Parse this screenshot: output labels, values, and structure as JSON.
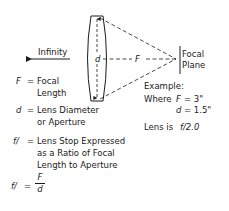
{
  "diagram": {
    "infinity_label": "Infinity",
    "lens_d_label": "d",
    "focal_F_label": "F",
    "focal_plane_label": [
      "Focal",
      "Plane"
    ],
    "legend": {
      "F": {
        "symbol": "F",
        "eq": "=",
        "line1": "Focal",
        "line2": "Length"
      },
      "d": {
        "symbol": "d",
        "eq": "=",
        "line1": "Lens Diameter",
        "line2": "or Aperture"
      },
      "f": {
        "symbol": "f/",
        "eq": "=",
        "line1": "Lens Stop Expressed",
        "line2": "as a Ratio of Focal",
        "line3": "Length to Aperture"
      },
      "formula": {
        "lhs": "f/",
        "eq": "=",
        "numerator": "F",
        "denominator": "d"
      }
    },
    "example": {
      "title": "Example:",
      "where": "Where",
      "F_symbol": "F",
      "F_value": "= 3\"",
      "d_symbol": "d",
      "d_value": "= 1.5\"",
      "result_prefix": "Lens is",
      "result_value": "f/2.0"
    }
  }
}
